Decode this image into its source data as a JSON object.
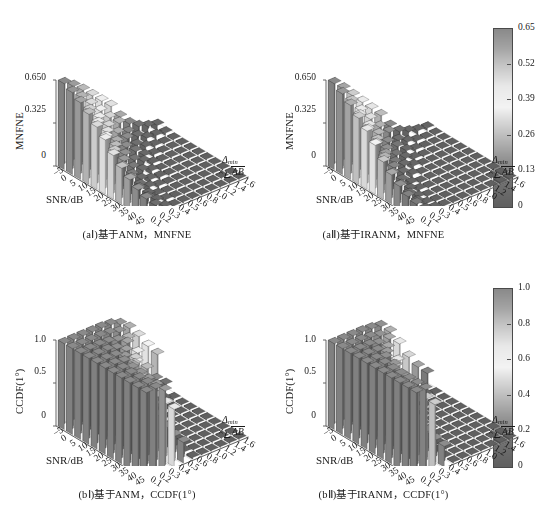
{
  "figure": {
    "panels": [
      {
        "id": "aI",
        "caption": "(aⅠ)基于ANM，MNFNE",
        "ylabel": "MNFNE",
        "xlabel": "SNR/dB",
        "zlabel_num": "Δmin",
        "zlabel_den": "AB",
        "zlabel_times": "×",
        "yticks": [
          "0",
          "0.325",
          "0.650"
        ],
        "xticks": [
          "−5",
          "0",
          "5",
          "10",
          "15",
          "20",
          "25",
          "30",
          "35",
          "40",
          "45"
        ],
        "zticks": [
          "0.1",
          "0.2",
          "0.3",
          "0.4",
          "0.5",
          "0.6",
          "0.8",
          "1.0",
          "1.2",
          "1.4",
          "1.6"
        ],
        "colorbar": {
          "ticks": [
            "0.65",
            "0.52",
            "0.39",
            "0.26",
            "0.13",
            "0"
          ],
          "min": 0,
          "max": 0.65
        }
      },
      {
        "id": "aII",
        "caption": "(aⅡ)基于IRANM，MNFNE",
        "ylabel": "MNFNE",
        "xlabel": "SNR/dB",
        "zlabel_num": "Δmin",
        "zlabel_den": "AB",
        "zlabel_times": "×",
        "yticks": [
          "0",
          "0.325",
          "0.650"
        ],
        "xticks": [
          "−5",
          "0",
          "5",
          "10",
          "15",
          "20",
          "25",
          "30",
          "35",
          "40",
          "45"
        ],
        "zticks": [
          "0.1",
          "0.2",
          "0.3",
          "0.4",
          "0.5",
          "0.6",
          "0.8",
          "1.0",
          "1.2",
          "1.4",
          "1.6"
        ],
        "colorbar": {
          "ticks": [
            "0.65",
            "0.52",
            "0.39",
            "0.26",
            "0.13",
            "0"
          ],
          "min": 0,
          "max": 0.65
        }
      },
      {
        "id": "bI",
        "caption": "(bⅠ)基于ANM，CCDF(1°)",
        "ylabel": "CCDF(1°)",
        "xlabel": "SNR/dB",
        "zlabel_num": "Δmin",
        "zlabel_den": "AB",
        "zlabel_times": "×",
        "yticks": [
          "0",
          "0.5",
          "1.0"
        ],
        "xticks": [
          "−5",
          "0",
          "5",
          "10",
          "15",
          "20",
          "25",
          "30",
          "35",
          "40",
          "45"
        ],
        "zticks": [
          "0.1",
          "0.2",
          "0.3",
          "0.4",
          "0.5",
          "0.6",
          "0.8",
          "1.0",
          "1.2",
          "1.4",
          "1.6"
        ],
        "colorbar": {
          "ticks": [
            "1.0",
            "0.8",
            "0.6",
            "0.4",
            "0.2",
            "0"
          ],
          "min": 0,
          "max": 1.0
        }
      },
      {
        "id": "bII",
        "caption": "(bⅡ)基于IRANM，CCDF(1°)",
        "ylabel": "CCDF(1°)",
        "xlabel": "SNR/dB",
        "zlabel_num": "Δmin",
        "zlabel_den": "AB",
        "zlabel_times": "×",
        "yticks": [
          "0",
          "0.5",
          "1.0"
        ],
        "xticks": [
          "−5",
          "0",
          "5",
          "10",
          "15",
          "20",
          "25",
          "30",
          "35",
          "40",
          "45"
        ],
        "zticks": [
          "0.1",
          "0.2",
          "0.3",
          "0.4",
          "0.5",
          "0.6",
          "0.8",
          "1.0",
          "1.2",
          "1.4",
          "1.6"
        ],
        "colorbar": {
          "ticks": [
            "1.0",
            "0.8",
            "0.6",
            "0.4",
            "0.2",
            "0"
          ],
          "min": 0,
          "max": 1.0
        }
      }
    ]
  },
  "chart_data": [
    {
      "id": "aI",
      "type": "bar",
      "title": "(aⅠ)基于ANM，MNFNE",
      "xlabel": "SNR/dB",
      "ylabel": "MNFNE",
      "zlabel": "Δmin × √(AB)",
      "x": [
        -5,
        0,
        5,
        10,
        15,
        20,
        25,
        30,
        35,
        40,
        45
      ],
      "z": [
        0.1,
        0.2,
        0.3,
        0.4,
        0.5,
        0.6,
        0.8,
        1.0,
        1.2,
        1.4,
        1.6
      ],
      "zlim": [
        0,
        0.65
      ],
      "grid": true,
      "colorbar_position": "right",
      "values": [
        [
          0.65,
          0.62,
          0.58,
          0.53,
          0.47,
          0.41,
          0.33,
          0.27,
          0.22,
          0.18,
          0.15
        ],
        [
          0.6,
          0.55,
          0.49,
          0.43,
          0.36,
          0.29,
          0.21,
          0.16,
          0.12,
          0.09,
          0.07
        ],
        [
          0.54,
          0.47,
          0.4,
          0.33,
          0.26,
          0.19,
          0.12,
          0.08,
          0.05,
          0.04,
          0.03
        ],
        [
          0.47,
          0.39,
          0.31,
          0.23,
          0.17,
          0.11,
          0.06,
          0.04,
          0.02,
          0.02,
          0.01
        ],
        [
          0.4,
          0.31,
          0.23,
          0.16,
          0.1,
          0.06,
          0.03,
          0.02,
          0.01,
          0.01,
          0.01
        ],
        [
          0.33,
          0.24,
          0.16,
          0.1,
          0.06,
          0.03,
          0.02,
          0.01,
          0.01,
          0.0,
          0.0
        ],
        [
          0.22,
          0.14,
          0.08,
          0.04,
          0.02,
          0.01,
          0.01,
          0.0,
          0.0,
          0.0,
          0.0
        ],
        [
          0.14,
          0.08,
          0.04,
          0.02,
          0.01,
          0.01,
          0.0,
          0.0,
          0.0,
          0.0,
          0.0
        ],
        [
          0.09,
          0.04,
          0.02,
          0.01,
          0.01,
          0.0,
          0.0,
          0.0,
          0.0,
          0.0,
          0.0
        ],
        [
          0.06,
          0.03,
          0.01,
          0.01,
          0.0,
          0.0,
          0.0,
          0.0,
          0.0,
          0.0,
          0.0
        ],
        [
          0.04,
          0.02,
          0.01,
          0.0,
          0.0,
          0.0,
          0.0,
          0.0,
          0.0,
          0.0,
          0.0
        ]
      ]
    },
    {
      "id": "aII",
      "type": "bar",
      "title": "(aⅡ)基于IRANM，MNFNE",
      "xlabel": "SNR/dB",
      "ylabel": "MNFNE",
      "zlabel": "Δmin × √(AB)",
      "x": [
        -5,
        0,
        5,
        10,
        15,
        20,
        25,
        30,
        35,
        40,
        45
      ],
      "z": [
        0.1,
        0.2,
        0.3,
        0.4,
        0.5,
        0.6,
        0.8,
        1.0,
        1.2,
        1.4,
        1.6
      ],
      "zlim": [
        0,
        0.65
      ],
      "grid": true,
      "colorbar_position": "right",
      "values": [
        [
          0.65,
          0.61,
          0.56,
          0.5,
          0.44,
          0.37,
          0.28,
          0.22,
          0.17,
          0.13,
          0.11
        ],
        [
          0.58,
          0.52,
          0.45,
          0.38,
          0.31,
          0.24,
          0.16,
          0.11,
          0.08,
          0.06,
          0.04
        ],
        [
          0.5,
          0.42,
          0.34,
          0.27,
          0.2,
          0.14,
          0.08,
          0.05,
          0.03,
          0.02,
          0.02
        ],
        [
          0.42,
          0.33,
          0.25,
          0.17,
          0.11,
          0.07,
          0.03,
          0.02,
          0.01,
          0.01,
          0.01
        ],
        [
          0.34,
          0.24,
          0.16,
          0.1,
          0.06,
          0.03,
          0.01,
          0.01,
          0.0,
          0.0,
          0.0
        ],
        [
          0.26,
          0.17,
          0.1,
          0.05,
          0.03,
          0.01,
          0.01,
          0.0,
          0.0,
          0.0,
          0.0
        ],
        [
          0.15,
          0.08,
          0.04,
          0.02,
          0.01,
          0.0,
          0.0,
          0.0,
          0.0,
          0.0,
          0.0
        ],
        [
          0.08,
          0.04,
          0.02,
          0.01,
          0.0,
          0.0,
          0.0,
          0.0,
          0.0,
          0.0,
          0.0
        ],
        [
          0.05,
          0.02,
          0.01,
          0.0,
          0.0,
          0.0,
          0.0,
          0.0,
          0.0,
          0.0,
          0.0
        ],
        [
          0.03,
          0.01,
          0.0,
          0.0,
          0.0,
          0.0,
          0.0,
          0.0,
          0.0,
          0.0,
          0.0
        ],
        [
          0.02,
          0.01,
          0.0,
          0.0,
          0.0,
          0.0,
          0.0,
          0.0,
          0.0,
          0.0,
          0.0
        ]
      ]
    },
    {
      "id": "bI",
      "type": "bar",
      "title": "(bⅠ)基于ANM，CCDF(1°)",
      "xlabel": "SNR/dB",
      "ylabel": "CCDF(1°)",
      "zlabel": "Δmin × √(AB)",
      "x": [
        -5,
        0,
        5,
        10,
        15,
        20,
        25,
        30,
        35,
        40,
        45
      ],
      "z": [
        0.1,
        0.2,
        0.3,
        0.4,
        0.5,
        0.6,
        0.8,
        1.0,
        1.2,
        1.4,
        1.6
      ],
      "zlim": [
        0,
        1.0
      ],
      "grid": true,
      "colorbar_position": "right",
      "values": [
        [
          1.0,
          1.0,
          1.0,
          1.0,
          1.0,
          1.0,
          1.0,
          1.0,
          1.0,
          1.0,
          1.0
        ],
        [
          1.0,
          1.0,
          1.0,
          1.0,
          1.0,
          1.0,
          1.0,
          1.0,
          1.0,
          1.0,
          1.0
        ],
        [
          1.0,
          1.0,
          1.0,
          1.0,
          0.99,
          0.98,
          0.96,
          0.95,
          0.94,
          0.93,
          0.93
        ],
        [
          1.0,
          1.0,
          0.99,
          0.97,
          0.93,
          0.88,
          0.8,
          0.74,
          0.7,
          0.68,
          0.67
        ],
        [
          1.0,
          0.99,
          0.96,
          0.9,
          0.8,
          0.68,
          0.5,
          0.38,
          0.3,
          0.26,
          0.24
        ],
        [
          0.99,
          0.96,
          0.89,
          0.76,
          0.58,
          0.4,
          0.18,
          0.09,
          0.05,
          0.03,
          0.02
        ],
        [
          0.95,
          0.84,
          0.62,
          0.36,
          0.15,
          0.05,
          0.01,
          0.0,
          0.0,
          0.0,
          0.0
        ],
        [
          0.86,
          0.63,
          0.32,
          0.11,
          0.03,
          0.01,
          0.0,
          0.0,
          0.0,
          0.0,
          0.0
        ],
        [
          0.72,
          0.4,
          0.14,
          0.03,
          0.01,
          0.0,
          0.0,
          0.0,
          0.0,
          0.0,
          0.0
        ],
        [
          0.56,
          0.23,
          0.06,
          0.01,
          0.0,
          0.0,
          0.0,
          0.0,
          0.0,
          0.0,
          0.0
        ],
        [
          0.42,
          0.13,
          0.02,
          0.0,
          0.0,
          0.0,
          0.0,
          0.0,
          0.0,
          0.0,
          0.0
        ]
      ]
    },
    {
      "id": "bII",
      "type": "bar",
      "title": "(bⅡ)基于IRANM，CCDF(1°)",
      "xlabel": "SNR/dB",
      "ylabel": "CCDF(1°)",
      "zlabel": "Δmin × √(AB)",
      "x": [
        -5,
        0,
        5,
        10,
        15,
        20,
        25,
        30,
        35,
        40,
        45
      ],
      "z": [
        0.1,
        0.2,
        0.3,
        0.4,
        0.5,
        0.6,
        0.8,
        1.0,
        1.2,
        1.4,
        1.6
      ],
      "zlim": [
        0,
        1.0
      ],
      "grid": true,
      "colorbar_position": "right",
      "values": [
        [
          1.0,
          1.0,
          1.0,
          1.0,
          1.0,
          1.0,
          1.0,
          1.0,
          1.0,
          1.0,
          1.0
        ],
        [
          1.0,
          1.0,
          1.0,
          1.0,
          1.0,
          1.0,
          0.99,
          0.99,
          0.99,
          0.99,
          0.99
        ],
        [
          1.0,
          1.0,
          1.0,
          0.99,
          0.97,
          0.94,
          0.88,
          0.83,
          0.8,
          0.78,
          0.77
        ],
        [
          1.0,
          0.99,
          0.97,
          0.92,
          0.82,
          0.7,
          0.5,
          0.37,
          0.3,
          0.26,
          0.24
        ],
        [
          0.99,
          0.96,
          0.88,
          0.73,
          0.52,
          0.32,
          0.11,
          0.04,
          0.02,
          0.01,
          0.01
        ],
        [
          0.97,
          0.88,
          0.68,
          0.42,
          0.19,
          0.07,
          0.01,
          0.0,
          0.0,
          0.0,
          0.0
        ],
        [
          0.86,
          0.58,
          0.25,
          0.07,
          0.01,
          0.0,
          0.0,
          0.0,
          0.0,
          0.0,
          0.0
        ],
        [
          0.68,
          0.3,
          0.07,
          0.01,
          0.0,
          0.0,
          0.0,
          0.0,
          0.0,
          0.0,
          0.0
        ],
        [
          0.48,
          0.13,
          0.02,
          0.0,
          0.0,
          0.0,
          0.0,
          0.0,
          0.0,
          0.0,
          0.0
        ],
        [
          0.32,
          0.05,
          0.0,
          0.0,
          0.0,
          0.0,
          0.0,
          0.0,
          0.0,
          0.0,
          0.0
        ],
        [
          0.2,
          0.02,
          0.0,
          0.0,
          0.0,
          0.0,
          0.0,
          0.0,
          0.0,
          0.0,
          0.0
        ]
      ]
    }
  ]
}
